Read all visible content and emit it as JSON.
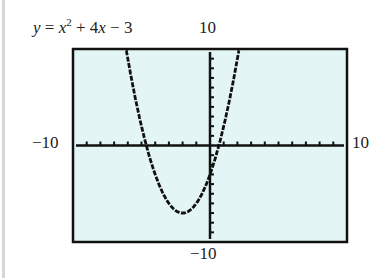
{
  "equation": {
    "y": "y",
    "eq": " = ",
    "x": "x",
    "exp": "2",
    "rest1": " + 4",
    "x2": "x",
    "rest2": " − 3"
  },
  "window": {
    "ymax_label": "10",
    "ymin_label": "−10",
    "xmin_label": "−10",
    "xmax_label": "10"
  },
  "colors": {
    "screen_bg": "#e3f5f5",
    "frame": "#111111",
    "curve": "#111111"
  },
  "chart_data": {
    "type": "line",
    "function": "x^2 + 4x - 3",
    "xlabel": "",
    "ylabel": "",
    "xlim": [
      -10,
      10
    ],
    "ylim": [
      -10,
      10
    ],
    "xscale": 1,
    "yscale": 1,
    "grid": false,
    "vertex": [
      -2,
      -7
    ],
    "x_intercepts": [
      -4.65,
      0.65
    ],
    "y_intercept": -3,
    "x": [
      -6.0,
      -5.5,
      -5,
      -4.5,
      -4,
      -3.5,
      -3,
      -2.5,
      -2,
      -1.5,
      -1,
      -0.5,
      0,
      0.5,
      1,
      1.5,
      2.0
    ],
    "y": [
      9,
      5.25,
      2,
      -0.75,
      -3,
      -4.75,
      -6,
      -6.75,
      -7,
      -6.75,
      -6,
      -4.75,
      -3,
      -0.75,
      2,
      5.25,
      9
    ]
  }
}
